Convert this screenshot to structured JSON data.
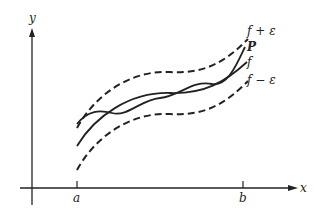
{
  "figure": {
    "axes": {
      "x_label": "x",
      "y_label": "y",
      "ticks": {
        "a": "a",
        "b": "b"
      }
    },
    "curves": [
      {
        "name": "upper-bound",
        "label": "f + ε",
        "style": "dashed"
      },
      {
        "name": "polynomial",
        "label": "P",
        "style": "solid"
      },
      {
        "name": "function",
        "label": "f",
        "style": "solid"
      },
      {
        "name": "lower-bound",
        "label": "f − ε",
        "style": "dashed"
      }
    ],
    "colors": {
      "ink": "#222222",
      "background": "#ffffff"
    }
  }
}
